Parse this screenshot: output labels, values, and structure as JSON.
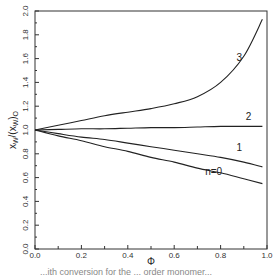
{
  "chart_data": {
    "type": "line",
    "title": "",
    "xlabel": "Φ",
    "ylabel": "x_W/(x_W)_0",
    "xlim": [
      0.0,
      1.0
    ],
    "ylim": [
      0.0,
      2.0
    ],
    "x_ticks": [
      "0.0",
      "0.2",
      "0.4",
      "0.6",
      "0.8",
      "1.0"
    ],
    "y_ticks": [
      "0.0",
      "0.2",
      "0.4",
      "0.6",
      "0.8",
      "1.0",
      "1.2",
      "1.4",
      "1.6",
      "1.8",
      "2.0"
    ],
    "grid": false,
    "legend": "inline curve labels",
    "x": [
      0.0,
      0.1,
      0.2,
      0.3,
      0.4,
      0.5,
      0.6,
      0.7,
      0.8,
      0.9,
      0.98
    ],
    "series": [
      {
        "name": "n=0",
        "label": "n=0",
        "values": [
          1.0,
          0.95,
          0.91,
          0.86,
          0.82,
          0.77,
          0.73,
          0.68,
          0.64,
          0.59,
          0.55
        ]
      },
      {
        "name": "1",
        "label": "1",
        "values": [
          1.0,
          0.97,
          0.94,
          0.92,
          0.89,
          0.86,
          0.83,
          0.8,
          0.77,
          0.73,
          0.69
        ]
      },
      {
        "name": "2",
        "label": "2",
        "values": [
          1.0,
          1.005,
          1.01,
          1.01,
          1.015,
          1.02,
          1.02,
          1.025,
          1.03,
          1.03,
          1.03
        ]
      },
      {
        "name": "3",
        "label": "3",
        "values": [
          1.0,
          1.04,
          1.08,
          1.12,
          1.15,
          1.18,
          1.22,
          1.28,
          1.4,
          1.62,
          1.93
        ]
      }
    ],
    "label_positions": {
      "3": [
        0.88,
        1.58
      ],
      "2": [
        0.92,
        1.08
      ],
      "1": [
        0.88,
        0.82
      ],
      "n=0": [
        0.77,
        0.62
      ]
    }
  },
  "caption": "...ith conversion for the ... order monomer..."
}
